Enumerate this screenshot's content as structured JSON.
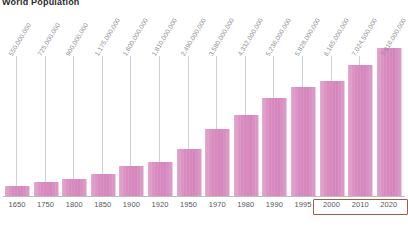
{
  "title": "World Population",
  "chart_data": {
    "type": "bar",
    "title": "World Population",
    "xlabel": "",
    "ylabel": "",
    "grid": false,
    "legend": false,
    "ylim": [
      0,
      7916000000
    ],
    "bar_color": "#d98cc0",
    "leader_line_color": "#ccd3d8",
    "baseline_color": "#b9bcc0",
    "highlight_color": "#a35a44",
    "categories": [
      "1650",
      "1750",
      "1800",
      "1850",
      "1900",
      "1920",
      "1950",
      "1970",
      "1980",
      "1990",
      "1995",
      "2000",
      "2010",
      "2020"
    ],
    "values": [
      550000000,
      725000000,
      900000000,
      1175000000,
      1600000000,
      1810000000,
      2490000000,
      3580000000,
      4332000000,
      5236000000,
      5828000000,
      6165000000,
      7024500000,
      7916000000
    ],
    "value_labels": [
      "550,000,000",
      "725,000,000",
      "900,000,000",
      "1,175,000,000",
      "1,600,000,000",
      "1,810,000,000",
      "2,490,000,000",
      "3,580,000,000",
      "4,332,000,000",
      "5,236,000,000",
      "5,828,000,000",
      "6,165,000,000",
      "7,024,500,000",
      "7,916,000,000"
    ],
    "highlighted_categories": [
      "2000",
      "2010",
      "2020"
    ]
  }
}
